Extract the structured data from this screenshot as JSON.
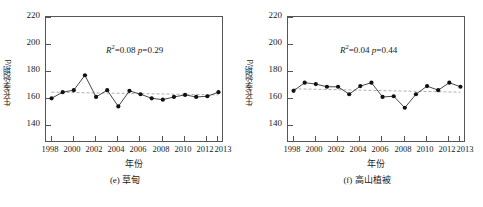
{
  "figure": {
    "axis_label_y": "生长季始期/d",
    "axis_label_x": "年份",
    "yticks": [
      140,
      160,
      180,
      200,
      220
    ],
    "xticks": [
      1998,
      2000,
      2002,
      2004,
      2006,
      2008,
      2010,
      2012,
      2013
    ],
    "colors": {
      "axis": "#555555",
      "marker": "#111111",
      "line": "#333333",
      "trend": "#999999",
      "background": "#ffffff"
    }
  },
  "panels": [
    {
      "key": "e",
      "caption": "(e) 草甸",
      "annotation_r2_label": "R",
      "annotation_r2_sup": "2",
      "annotation": "=0.08 ",
      "annotation_p_label": "p",
      "annotation_p_value": "=0.29"
    },
    {
      "key": "f",
      "caption": "(f) 高山植被",
      "annotation_r2_label": "R",
      "annotation_r2_sup": "2",
      "annotation": "=0.04 ",
      "annotation_p_label": "p",
      "annotation_p_value": "=0.44"
    }
  ],
  "chart_data": [
    {
      "type": "line",
      "panel": "e",
      "title": "(e) 草甸",
      "xlabel": "年份",
      "ylabel": "生长季始期/d",
      "xlim": [
        1997.5,
        2013.5
      ],
      "ylim": [
        133,
        226
      ],
      "grid": false,
      "legend": null,
      "annotations": [
        "R2=0.08",
        "p=0.29"
      ],
      "r_squared": 0.08,
      "p_value": 0.29,
      "x": [
        1998,
        1999,
        2000,
        2001,
        2002,
        2003,
        2004,
        2005,
        2006,
        2007,
        2008,
        2009,
        2010,
        2011,
        2012,
        2013
      ],
      "values": [
        166,
        170.5,
        172,
        183,
        167,
        172,
        160,
        171.5,
        169,
        166,
        165,
        167,
        168.5,
        167,
        167.5,
        170.5
      ],
      "trend": {
        "start_year": 1998,
        "start_value": 170.5,
        "end_year": 2013,
        "end_value": 168.5,
        "style": "dashed"
      }
    },
    {
      "type": "line",
      "panel": "f",
      "title": "(f) 高山植被",
      "xlabel": "年份",
      "ylabel": "生长季始期/d",
      "xlim": [
        1997.5,
        2013.5
      ],
      "ylim": [
        133,
        226
      ],
      "grid": false,
      "legend": null,
      "annotations": [
        "R2=0.04",
        "p=0.44"
      ],
      "r_squared": 0.04,
      "p_value": 0.44,
      "x": [
        1998,
        1999,
        2000,
        2001,
        2002,
        2003,
        2004,
        2005,
        2006,
        2007,
        2008,
        2009,
        2010,
        2011,
        2012,
        2013
      ],
      "values": [
        171.5,
        177.5,
        176.5,
        174.5,
        174.5,
        169,
        175,
        177.5,
        167,
        167.5,
        159,
        169,
        175,
        172,
        177.5,
        174.5
      ],
      "trend": {
        "start_year": 1998,
        "start_value": 173,
        "end_year": 2013,
        "end_value": 170.5,
        "style": "dashed"
      }
    }
  ]
}
